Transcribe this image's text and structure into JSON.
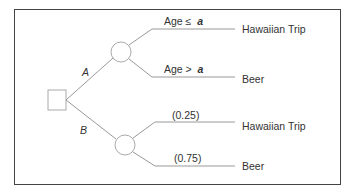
{
  "diagram": {
    "type": "decision-tree",
    "decision_node": {
      "shape": "square"
    },
    "branches": [
      {
        "label": "A",
        "chance_node": {
          "shape": "circle"
        },
        "outcomes": [
          {
            "condition_prefix": "Age ≤",
            "condition_var": "a",
            "result": "Hawaiian Trip"
          },
          {
            "condition_prefix": "Age >",
            "condition_var": "a",
            "result": "Beer"
          }
        ]
      },
      {
        "label": "B",
        "chance_node": {
          "shape": "circle"
        },
        "outcomes": [
          {
            "probability": "(0.25)",
            "result": "Hawaiian Trip"
          },
          {
            "probability": "(0.75)",
            "result": "Beer"
          }
        ]
      }
    ],
    "colors": {
      "lines": "#999999",
      "border": "#444444",
      "text": "#333333"
    }
  }
}
